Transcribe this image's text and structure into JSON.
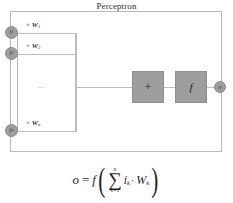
{
  "diagram": {
    "title": "Perceptron",
    "inputs": [
      {
        "node_label": "i",
        "node_sub": "1",
        "weight_times": "×",
        "weight_symbol": "W",
        "weight_sub": "1"
      },
      {
        "node_label": "i",
        "node_sub": "2",
        "weight_times": "×",
        "weight_symbol": "W",
        "weight_sub": "2"
      },
      {
        "node_label": "i",
        "node_sub": "n",
        "weight_times": "×",
        "weight_symbol": "W",
        "weight_sub": "n"
      }
    ],
    "ellipsis": "...",
    "sum_box_label": "+",
    "activation_box_label": "f",
    "output_node_label": "o",
    "formula": {
      "output": "o",
      "equals": "=",
      "function": "f",
      "paren_open": "(",
      "paren_close": ")",
      "sigma": "∑",
      "sigma_upper": "n",
      "sigma_lower": "k=1",
      "term_i": "i",
      "term_i_sub": "k",
      "dot": "·",
      "term_w": "W",
      "term_w_sub": "k",
      "plain_text": "o = f( ∑ (k=1 to n) i_k · W_k )"
    },
    "colors": {
      "box_fill": "#9e9e9e",
      "node_fill": "#9e9e9e",
      "line": "#bdbdbd",
      "text": "#2b2b2b",
      "background": "#ffffff"
    }
  }
}
